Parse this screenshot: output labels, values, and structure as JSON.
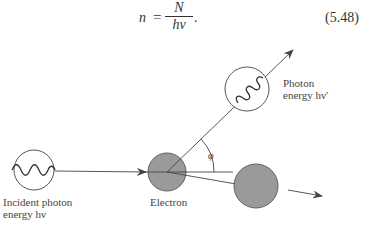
{
  "equation": {
    "lhs": "n",
    "equals": "=",
    "numerator": "N",
    "denominator": "hν",
    "trailing": ".",
    "number": "(5.48)"
  },
  "diagram": {
    "labels": {
      "incident_line1": "Incident photon",
      "incident_line2": "energy hν",
      "electron": "Electron",
      "scattered_line1": "Photon",
      "scattered_line2": "energy hν′",
      "angle": "φ"
    },
    "colors": {
      "electron_fill": "#9a9a9a",
      "stroke": "#444444",
      "background": "#ffffff"
    }
  }
}
